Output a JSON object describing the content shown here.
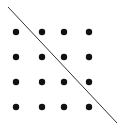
{
  "diagram": {
    "grid": {
      "rows": 4,
      "cols": 4,
      "x": [
        16,
        42,
        64,
        89
      ],
      "y": [
        32,
        57,
        82,
        107
      ],
      "dot_radius": 3.2,
      "dot_color": "#111111"
    },
    "line": {
      "x1": 8,
      "y1": 7,
      "x2": 117,
      "y2": 123,
      "color": "#333333",
      "width": 1
    },
    "background": "#ffffff"
  }
}
